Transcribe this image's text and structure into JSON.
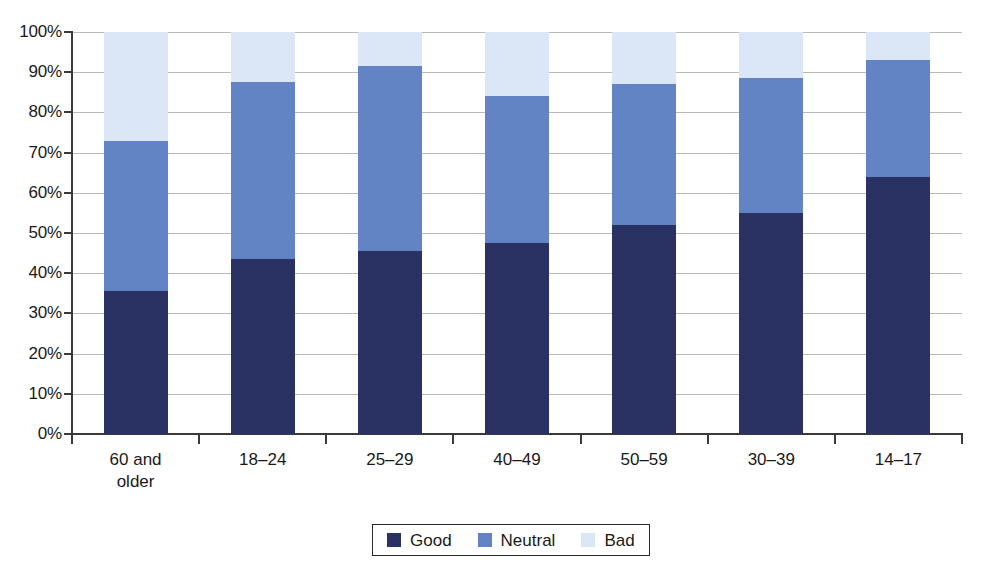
{
  "chart_data": {
    "type": "bar",
    "subtype": "stacked-percentage-column",
    "title": "",
    "xlabel": "",
    "ylabel": "",
    "ylim": [
      0,
      100
    ],
    "ytick_labels": [
      "100%",
      "90%",
      "80%",
      "70%",
      "60%",
      "50%",
      "40%",
      "30%",
      "20%",
      "10%",
      "0%"
    ],
    "ytick_values": [
      100,
      90,
      80,
      70,
      60,
      50,
      40,
      30,
      20,
      10,
      0
    ],
    "grid": true,
    "legend_position": "bottom-center",
    "categories": [
      "60 and\nolder",
      "18–24",
      "25–29",
      "40–49",
      "50–59",
      "30–39",
      "14–17"
    ],
    "series": [
      {
        "name": "Good",
        "color": "#2a3263",
        "values": [
          35.5,
          43.5,
          45.5,
          47.5,
          52.0,
          55.0,
          64.0
        ]
      },
      {
        "name": "Neutral",
        "color": "#6384c4",
        "values": [
          37.5,
          44.0,
          46.0,
          36.5,
          35.0,
          33.5,
          29.0
        ]
      },
      {
        "name": "Bad",
        "color": "#dbe7f7",
        "values": [
          27.0,
          12.5,
          8.5,
          16.0,
          13.0,
          11.5,
          7.0
        ]
      }
    ],
    "cumulative_tops": {
      "good": [
        35.5,
        43.5,
        45.5,
        47.5,
        52.0,
        55.0,
        64.0
      ],
      "neutral": [
        73.0,
        87.5,
        91.5,
        84.0,
        87.0,
        88.5,
        93.0
      ],
      "bad": [
        100,
        100,
        100,
        100,
        100,
        100,
        100
      ]
    }
  },
  "legend": {
    "items": [
      {
        "label": "Good",
        "color": "#2a3263"
      },
      {
        "label": "Neutral",
        "color": "#6384c4"
      },
      {
        "label": "Bad",
        "color": "#dbe7f7"
      }
    ]
  },
  "colors": {
    "good": "#2a3263",
    "neutral": "#6384c4",
    "bad": "#dbe7f7",
    "axis": "#3a3a3a",
    "gridline": "#b9b9b9",
    "background": "#ffffff"
  }
}
